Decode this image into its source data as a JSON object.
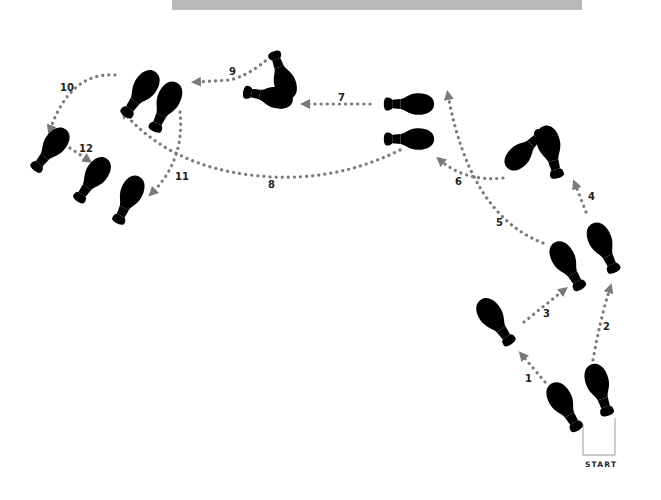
{
  "diagram": {
    "type": "dance-footwork-diagram",
    "top_bar_color": "#b9b9b9",
    "colors": {
      "dark_foot_fill": "#6b6b6b",
      "dark_foot_outline": "#1a1a1a",
      "light_foot_fill": "#e6e6e6",
      "light_foot_outline": "#8a8a8a",
      "path_dots": "#7a7a7a"
    },
    "start_label": "START",
    "steps": [
      {
        "n": "1",
        "label": "1"
      },
      {
        "n": "2",
        "label": "2"
      },
      {
        "n": "3",
        "label": "3"
      },
      {
        "n": "4",
        "label": "4"
      },
      {
        "n": "5",
        "label": "5"
      },
      {
        "n": "6",
        "label": "6"
      },
      {
        "n": "7",
        "label": "7"
      },
      {
        "n": "8",
        "label": "8"
      },
      {
        "n": "9",
        "label": "9"
      },
      {
        "n": "10",
        "label": "10"
      },
      {
        "n": "11",
        "label": "11"
      },
      {
        "n": "12",
        "label": "12"
      }
    ],
    "legend": {
      "dark_foot": "dark footprint",
      "light_foot": "light footprint",
      "dashed_foot": "pivot / turn position"
    }
  }
}
